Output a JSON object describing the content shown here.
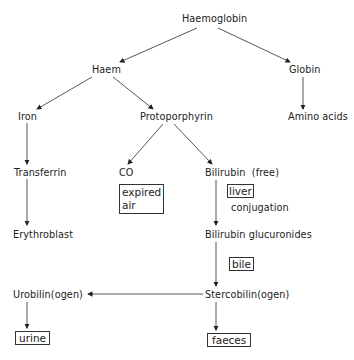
{
  "diagram": {
    "nodes": {
      "haemoglobin": "Haemoglobin",
      "haem": "Haem",
      "globin": "Globin",
      "iron": "Iron",
      "protoporphyrin": "Protoporphyrin",
      "amino_acids": "Amino acids",
      "transferrin": "Transferrin",
      "co": "CO",
      "bilirubin_free": "Bilirubin  (free)",
      "erythroblast": "Erythroblast",
      "bilirubin_glucuronides": "Bilirubin glucuronides",
      "urobilinogen": "Urobilin(ogen)",
      "stercobilinogen": "Stercobilin(ogen)"
    },
    "boxed_labels": {
      "expired_air_line1": "expired",
      "expired_air_line2": "air",
      "liver": "liver",
      "bile": "bile",
      "urine": "urine",
      "faeces": "faeces"
    },
    "annotations": {
      "conjugation": "conjugation"
    },
    "edges": [
      {
        "from": "Haemoglobin",
        "to": "Haem"
      },
      {
        "from": "Haemoglobin",
        "to": "Globin"
      },
      {
        "from": "Haem",
        "to": "Iron"
      },
      {
        "from": "Haem",
        "to": "Protoporphyrin"
      },
      {
        "from": "Globin",
        "to": "Amino acids"
      },
      {
        "from": "Iron",
        "to": "Transferrin"
      },
      {
        "from": "Transferrin",
        "to": "Erythroblast"
      },
      {
        "from": "Protoporphyrin",
        "to": "CO"
      },
      {
        "from": "Protoporphyrin",
        "to": "Bilirubin (free)"
      },
      {
        "from": "Bilirubin (free)",
        "to": "Bilirubin glucuronides"
      },
      {
        "from": "Bilirubin glucuronides",
        "to": "Stercobilin(ogen)"
      },
      {
        "from": "Stercobilin(ogen)",
        "to": "Urobilin(ogen)"
      },
      {
        "from": "Stercobilin(ogen)",
        "to": "faeces"
      },
      {
        "from": "Urobilin(ogen)",
        "to": "urine"
      }
    ]
  }
}
